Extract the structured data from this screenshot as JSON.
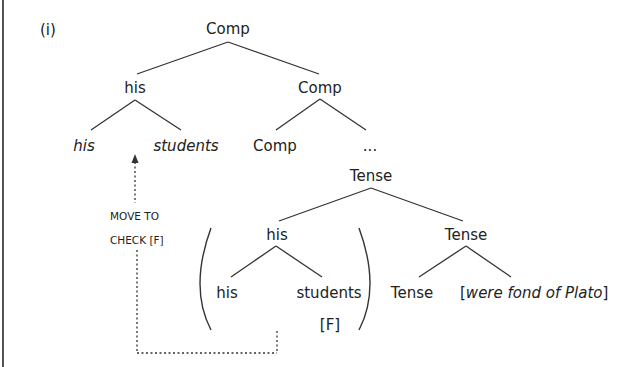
{
  "example_label": "(i)",
  "tree": {
    "root": "Comp",
    "level1": {
      "left": "his",
      "right": "Comp"
    },
    "level2": {
      "his_left": "his",
      "his_right": "students",
      "comp_left": "Comp",
      "comp_right": "..."
    },
    "tense_top": "Tense",
    "tense_branch": {
      "subject": "his",
      "subject_children": [
        "his",
        "students"
      ],
      "feature": "[F]",
      "right": "Tense",
      "right_children": {
        "head": "Tense",
        "predicate_open": "[",
        "predicate": "were fond of Plato",
        "predicate_close": "]"
      }
    }
  },
  "movement": {
    "label_line1": "MOVE TO",
    "label_line2": "CHECK [F]"
  },
  "colors": {
    "ink": "#222222",
    "background": "#ffffff",
    "frame": "#555555"
  }
}
